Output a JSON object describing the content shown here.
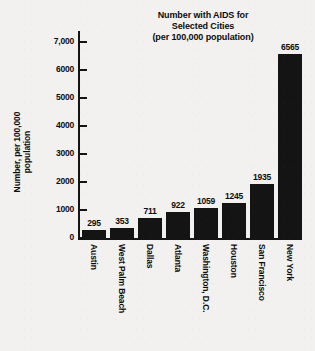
{
  "chart_data": {
    "type": "bar",
    "title": "Number with AIDS for Selected Cities (per 100,000 population)",
    "title_lines": [
      "Number with AIDS for",
      "Selected Cities",
      "(per 100,000 population)"
    ],
    "xlabel": "",
    "ylabel": "Number, per 100,000 population",
    "ylabel_lines": [
      "Number, per 100,000",
      "population"
    ],
    "categories": [
      "Austin",
      "West Palm Beach",
      "Dallas",
      "Atlanta",
      "Washington, D.C.",
      "Houston",
      "San Francisco",
      "New York"
    ],
    "values": [
      295,
      353,
      711,
      922,
      1059,
      1245,
      1935,
      6565
    ],
    "value_labels": [
      "295",
      "353",
      "711",
      "922",
      "1059",
      "1245",
      "1935",
      "6565"
    ],
    "ylim": [
      0,
      7400
    ],
    "yticks": [
      0,
      1000,
      2000,
      3000,
      4000,
      5000,
      6000,
      7000
    ],
    "ytick_labels": [
      "0",
      "1000",
      "2000",
      "3000",
      "4000",
      "5000",
      "6000",
      "7,000"
    ],
    "grid": false,
    "legend": false,
    "bar_color": "#141414",
    "background_color": "#f2f1ef",
    "text_color": "#0d0d0d"
  }
}
